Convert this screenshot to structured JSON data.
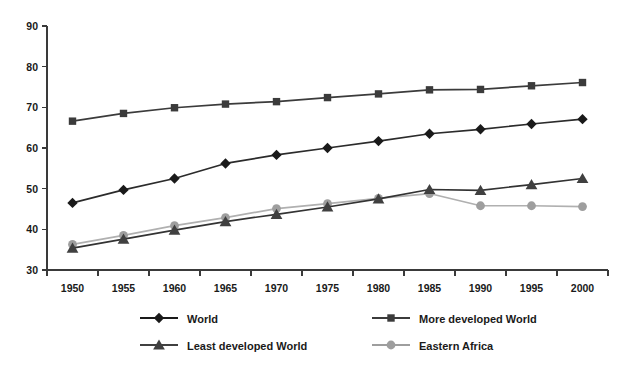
{
  "chart_data": {
    "type": "line",
    "title": "",
    "subtitle": "",
    "xlabel": "",
    "ylabel": "",
    "x": [
      1950,
      1955,
      1960,
      1965,
      1970,
      1975,
      1980,
      1985,
      1990,
      1995,
      2000
    ],
    "categories": [
      "1950",
      "1955",
      "1960",
      "1965",
      "1970",
      "1975",
      "1980",
      "1985",
      "1990",
      "1995",
      "2000"
    ],
    "ylim": [
      30,
      90
    ],
    "yticks": [
      30,
      40,
      50,
      60,
      70,
      80,
      90
    ],
    "ytick_labels": [
      "30",
      "40",
      "50",
      "60",
      "70",
      "80",
      "90"
    ],
    "xlim": [
      1950,
      2000
    ],
    "grid": false,
    "legend_position": "bottom",
    "series": [
      {
        "name": "World",
        "marker": "diamond",
        "color": "#1a1a1a",
        "line_color": "#2b2b2b",
        "values": [
          46.5,
          49.7,
          52.5,
          56.2,
          58.3,
          60.0,
          61.7,
          63.5,
          64.6,
          65.9,
          67.1
        ]
      },
      {
        "name": "More developed World",
        "marker": "square",
        "color": "#3b3b3b",
        "line_color": "#3b3b3b",
        "values": [
          66.6,
          68.5,
          69.9,
          70.8,
          71.4,
          72.4,
          73.3,
          74.3,
          74.4,
          75.3,
          76.1
        ]
      },
      {
        "name": "Least developed World",
        "marker": "triangle",
        "color": "#404040",
        "line_color": "#333333",
        "values": [
          35.4,
          37.6,
          39.8,
          41.9,
          43.7,
          45.5,
          47.5,
          49.8,
          49.6,
          51.0,
          52.5
        ]
      },
      {
        "name": "Eastern Africa",
        "marker": "circle",
        "color": "#9e9e9e",
        "line_color": "#b0b0b0",
        "values": [
          36.3,
          38.5,
          40.9,
          42.9,
          45.1,
          46.3,
          47.6,
          48.8,
          45.8,
          45.8,
          45.6
        ]
      }
    ]
  },
  "legend": {
    "entries": [
      {
        "label": "World",
        "marker": "diamond-icon",
        "color": "#1a1a1a"
      },
      {
        "label": "More developed World",
        "marker": "square-icon",
        "color": "#3b3b3b"
      },
      {
        "label": "Least developed World",
        "marker": "triangle-icon",
        "color": "#404040"
      },
      {
        "label": "Eastern Africa",
        "marker": "circle-icon",
        "color": "#9e9e9e"
      }
    ]
  }
}
